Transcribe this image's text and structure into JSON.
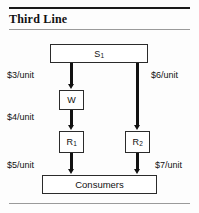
{
  "header": {
    "title": "Third Line"
  },
  "diagram": {
    "nodes": [
      {
        "id": "s1",
        "label": "S",
        "sub": "1",
        "name": "supplier-node"
      },
      {
        "id": "w",
        "label": "W",
        "sub": "",
        "name": "warehouse-node"
      },
      {
        "id": "r1",
        "label": "R",
        "sub": "1",
        "name": "retailer-1-node"
      },
      {
        "id": "r2",
        "label": "R",
        "sub": "2",
        "name": "retailer-2-node"
      },
      {
        "id": "consumers",
        "label": "Consumers",
        "sub": "",
        "name": "consumers-node"
      }
    ],
    "edges": [
      {
        "id": "s1-w",
        "cost": "$3/unit"
      },
      {
        "id": "w-r1",
        "cost": "$4/unit"
      },
      {
        "id": "r1-c",
        "cost": "$5/unit"
      },
      {
        "id": "s1-r2",
        "cost": "$6/unit"
      },
      {
        "id": "r2-c",
        "cost": "$7/unit"
      }
    ]
  },
  "colors": {
    "ink": "#111111",
    "rule_dark": "#1a1a1a",
    "rule_light": "#9a9a9a",
    "background": "#fdfdfd"
  }
}
